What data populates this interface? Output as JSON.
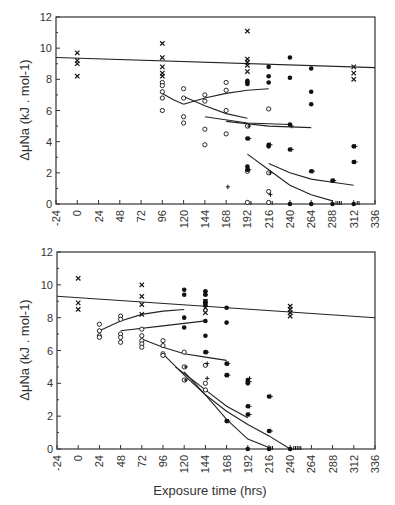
{
  "chart_data": [
    {
      "type": "scatter",
      "title": "",
      "xlabel": "",
      "ylabel": "ΔμNa (kJ . mol-1)",
      "xlim": [
        -24,
        336
      ],
      "ylim": [
        0,
        12
      ],
      "xticks": [
        -24,
        0,
        24,
        48,
        72,
        96,
        120,
        144,
        168,
        192,
        216,
        240,
        264,
        288,
        312,
        336
      ],
      "yticks": [
        0,
        2,
        4,
        6,
        8,
        10,
        12
      ],
      "grid": false,
      "series": [
        {
          "name": "x",
          "marker": "x",
          "points": [
            [
              0,
              9.7
            ],
            [
              0,
              9.2
            ],
            [
              0,
              9.0
            ],
            [
              0,
              8.2
            ],
            [
              96,
              10.3
            ],
            [
              96,
              9.4
            ],
            [
              96,
              8.8
            ],
            [
              96,
              8.4
            ],
            [
              96,
              8.2
            ],
            [
              192,
              11.1
            ],
            [
              192,
              9.3
            ],
            [
              192,
              9.1
            ],
            [
              192,
              8.9
            ],
            [
              192,
              8.5
            ],
            [
              312,
              8.8
            ],
            [
              312,
              8.4
            ],
            [
              312,
              8.0
            ]
          ]
        },
        {
          "name": "open circle",
          "marker": "o",
          "points": [
            [
              96,
              7.8
            ],
            [
              96,
              7.6
            ],
            [
              96,
              7.2
            ],
            [
              96,
              6.8
            ],
            [
              96,
              6.0
            ],
            [
              120,
              7.4
            ],
            [
              120,
              6.8
            ],
            [
              120,
              5.6
            ],
            [
              120,
              5.2
            ],
            [
              144,
              7.0
            ],
            [
              144,
              6.6
            ],
            [
              144,
              4.8
            ],
            [
              144,
              3.8
            ],
            [
              168,
              7.8
            ],
            [
              168,
              7.3
            ],
            [
              168,
              6.0
            ],
            [
              168,
              4.5
            ],
            [
              192,
              5.0
            ],
            [
              192,
              2.1
            ],
            [
              192,
              0.1
            ],
            [
              216,
              6.1
            ],
            [
              216,
              2.0
            ],
            [
              216,
              0.8
            ],
            [
              216,
              0.1
            ]
          ]
        },
        {
          "name": "filled circle",
          "marker": "dot",
          "points": [
            [
              192,
              7.9
            ],
            [
              192,
              7.8
            ],
            [
              192,
              7.7
            ],
            [
              192,
              4.2
            ],
            [
              192,
              2.4
            ],
            [
              192,
              2.2
            ],
            [
              216,
              8.8
            ],
            [
              216,
              8.2
            ],
            [
              216,
              7.8
            ],
            [
              216,
              3.8
            ],
            [
              216,
              3.7
            ],
            [
              240,
              9.4
            ],
            [
              240,
              8.1
            ],
            [
              240,
              5.1
            ],
            [
              240,
              3.5
            ],
            [
              240,
              0.0
            ],
            [
              264,
              8.7
            ],
            [
              264,
              7.2
            ],
            [
              264,
              6.4
            ],
            [
              264,
              2.1
            ],
            [
              264,
              0.0
            ],
            [
              288,
              1.5
            ],
            [
              288,
              0.0
            ],
            [
              312,
              3.7
            ],
            [
              312,
              2.7
            ],
            [
              312,
              0.0
            ]
          ]
        },
        {
          "name": "plus",
          "marker": "plus",
          "points": [
            [
              170,
              1.1
            ],
            [
              194,
              5.0
            ],
            [
              194,
              4.2
            ],
            [
              194,
              2.2
            ],
            [
              218,
              3.8
            ],
            [
              218,
              2.0
            ],
            [
              218,
              0.6
            ],
            [
              242,
              5.0
            ],
            [
              242,
              3.5
            ],
            [
              266,
              2.1
            ],
            [
              290,
              1.5
            ],
            [
              314,
              3.7
            ],
            [
              314,
              2.7
            ]
          ]
        },
        {
          "name": "zero tally",
          "marker": "bar",
          "points": [
            [
              196,
              0
            ],
            [
              220,
              0
            ],
            [
              292,
              0
            ],
            [
              294,
              0
            ],
            [
              296,
              0
            ],
            [
              298,
              0
            ],
            [
              316,
              0
            ],
            [
              318,
              0
            ]
          ]
        }
      ],
      "lines": [
        {
          "points": [
            [
              -24,
              9.4
            ],
            [
              336,
              8.75
            ]
          ]
        },
        {
          "points": [
            [
              96,
              7.1
            ],
            [
              108,
              6.7
            ],
            [
              120,
              6.4
            ]
          ]
        },
        {
          "points": [
            [
              120,
              6.4
            ],
            [
              144,
              6.8
            ],
            [
              168,
              7.1
            ],
            [
              192,
              7.3
            ],
            [
              216,
              7.4
            ]
          ]
        },
        {
          "points": [
            [
              120,
              6.9
            ],
            [
              144,
              6.3
            ],
            [
              168,
              5.8
            ],
            [
              192,
              5.5
            ]
          ]
        },
        {
          "points": [
            [
              144,
              5.6
            ],
            [
              192,
              5.2
            ],
            [
              240,
              5.1
            ]
          ]
        },
        {
          "points": [
            [
              168,
              5.3
            ],
            [
              216,
              5.0
            ],
            [
              264,
              4.9
            ]
          ]
        },
        {
          "points": [
            [
              192,
              3.2
            ],
            [
              216,
              2.2
            ],
            [
              240,
              1.2
            ],
            [
              264,
              0.6
            ],
            [
              288,
              0.2
            ]
          ]
        },
        {
          "points": [
            [
              216,
              2.6
            ],
            [
              240,
              2.0
            ],
            [
              264,
              1.6
            ],
            [
              288,
              1.4
            ],
            [
              312,
              1.2
            ]
          ]
        }
      ]
    },
    {
      "type": "scatter",
      "title": "",
      "xlabel": "Exposure time (hrs)",
      "ylabel": "ΔμNa (kJ . mol-1)",
      "xlim": [
        -24,
        336
      ],
      "ylim": [
        0,
        12
      ],
      "xticks": [
        -24,
        0,
        24,
        48,
        72,
        96,
        120,
        144,
        168,
        192,
        216,
        240,
        264,
        288,
        312,
        336
      ],
      "yticks": [
        0,
        2,
        4,
        6,
        8,
        10,
        12
      ],
      "grid": false,
      "series": [
        {
          "name": "x",
          "marker": "x",
          "points": [
            [
              0,
              10.4
            ],
            [
              0,
              8.9
            ],
            [
              0,
              8.5
            ],
            [
              72,
              10.0
            ],
            [
              72,
              9.3
            ],
            [
              72,
              8.8
            ],
            [
              72,
              8.2
            ],
            [
              144,
              9.5
            ],
            [
              144,
              9.0
            ],
            [
              144,
              8.8
            ],
            [
              144,
              8.6
            ],
            [
              144,
              8.3
            ],
            [
              240,
              8.7
            ],
            [
              240,
              8.5
            ],
            [
              240,
              8.3
            ],
            [
              240,
              8.1
            ]
          ]
        },
        {
          "name": "open circle",
          "marker": "o",
          "points": [
            [
              24,
              7.6
            ],
            [
              24,
              7.2
            ],
            [
              24,
              6.9
            ],
            [
              24,
              6.8
            ],
            [
              48,
              8.1
            ],
            [
              48,
              7.9
            ],
            [
              48,
              7.0
            ],
            [
              48,
              6.8
            ],
            [
              48,
              6.5
            ],
            [
              72,
              7.3
            ],
            [
              72,
              6.9
            ],
            [
              72,
              6.6
            ],
            [
              72,
              6.4
            ],
            [
              72,
              6.2
            ],
            [
              96,
              6.6
            ],
            [
              96,
              6.3
            ],
            [
              96,
              5.8
            ],
            [
              96,
              5.7
            ],
            [
              120,
              5.9
            ],
            [
              120,
              5.0
            ],
            [
              120,
              4.2
            ],
            [
              144,
              5.1
            ],
            [
              144,
              4.0
            ],
            [
              144,
              3.6
            ]
          ]
        },
        {
          "name": "filled circle",
          "marker": "dot",
          "points": [
            [
              120,
              9.7
            ],
            [
              120,
              9.4
            ],
            [
              120,
              8.0
            ],
            [
              120,
              7.4
            ],
            [
              144,
              9.6
            ],
            [
              144,
              9.4
            ],
            [
              144,
              9.0
            ],
            [
              144,
              8.8
            ],
            [
              144,
              7.8
            ],
            [
              144,
              6.9
            ],
            [
              144,
              5.9
            ],
            [
              168,
              8.6
            ],
            [
              168,
              7.7
            ],
            [
              168,
              5.2
            ],
            [
              168,
              4.5
            ],
            [
              168,
              1.7
            ],
            [
              192,
              4.2
            ],
            [
              192,
              4.1
            ],
            [
              192,
              4.0
            ],
            [
              192,
              2.6
            ],
            [
              192,
              2.1
            ],
            [
              192,
              0.0
            ],
            [
              216,
              3.2
            ],
            [
              216,
              1.1
            ],
            [
              216,
              0.0
            ],
            [
              240,
              0.0
            ]
          ]
        },
        {
          "name": "plus",
          "marker": "plus",
          "points": [
            [
              122,
              5.0
            ],
            [
              122,
              4.2
            ],
            [
              146,
              5.9
            ],
            [
              146,
              5.2
            ],
            [
              146,
              4.3
            ],
            [
              170,
              5.2
            ],
            [
              170,
              4.5
            ],
            [
              170,
              1.7
            ],
            [
              194,
              4.3
            ],
            [
              194,
              4.1
            ],
            [
              194,
              2.6
            ],
            [
              194,
              2.1
            ],
            [
              218,
              3.2
            ],
            [
              218,
              1.1
            ]
          ]
        },
        {
          "name": "zero tally",
          "marker": "bar",
          "points": [
            [
              218,
              0
            ],
            [
              220,
              0
            ],
            [
              244,
              0
            ],
            [
              246,
              0
            ],
            [
              248,
              0
            ],
            [
              250,
              0
            ],
            [
              252,
              0
            ]
          ]
        }
      ],
      "lines": [
        {
          "points": [
            [
              -24,
              9.3
            ],
            [
              336,
              8.0
            ]
          ]
        },
        {
          "points": [
            [
              24,
              7.2
            ],
            [
              48,
              7.8
            ],
            [
              72,
              8.2
            ],
            [
              96,
              8.4
            ],
            [
              120,
              8.5
            ]
          ]
        },
        {
          "points": [
            [
              48,
              7.2
            ],
            [
              96,
              7.5
            ],
            [
              144,
              7.8
            ]
          ]
        },
        {
          "points": [
            [
              72,
              6.7
            ],
            [
              96,
              6.2
            ],
            [
              120,
              5.8
            ],
            [
              144,
              5.6
            ],
            [
              168,
              5.4
            ]
          ]
        },
        {
          "points": [
            [
              96,
              5.8
            ],
            [
              120,
              4.5
            ],
            [
              144,
              3.3
            ],
            [
              168,
              2.3
            ],
            [
              192,
              1.5
            ],
            [
              216,
              0.8
            ],
            [
              240,
              0.0
            ]
          ]
        },
        {
          "points": [
            [
              110,
              5.0
            ],
            [
              120,
              4.6
            ],
            [
              144,
              3.6
            ],
            [
              168,
              2.6
            ],
            [
              192,
              1.9
            ]
          ]
        },
        {
          "points": [
            [
              120,
              4.7
            ],
            [
              144,
              3.3
            ],
            [
              168,
              1.8
            ],
            [
              192,
              0.6
            ],
            [
              216,
              0.1
            ]
          ]
        }
      ]
    }
  ],
  "panels": [
    {
      "ylabel": "ΔμNa (kJ . mol-1)"
    },
    {
      "ylabel": "ΔμNa (kJ . mol-1)",
      "xlabel": "Exposure time (hrs)"
    }
  ]
}
